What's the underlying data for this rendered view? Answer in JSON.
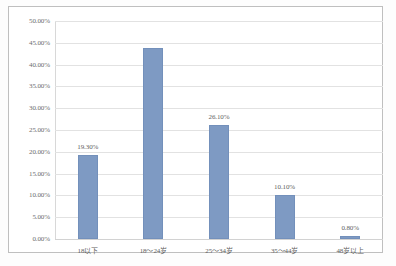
{
  "chart_data": {
    "type": "bar",
    "title": "",
    "subtitle": "",
    "xlabel": "",
    "ylabel": "",
    "categories": [
      "18以下",
      "18～24岁",
      "25～34岁",
      "35～44岁",
      "48岁以上"
    ],
    "values": [
      19.3,
      43.8,
      26.1,
      10.1,
      0.8
    ],
    "data_labels": [
      "19.30%",
      "",
      "26.10%",
      "10.10%",
      "0.80%"
    ],
    "ylim": [
      0,
      50
    ],
    "ytick_values": [
      0,
      5,
      10,
      15,
      20,
      25,
      30,
      35,
      40,
      45,
      50
    ],
    "ytick_labels": [
      "0.00%",
      "5.00%",
      "10.00%",
      "15.00%",
      "20.00%",
      "25.00%",
      "30.00%",
      "35.00%",
      "40.00%",
      "45.00%",
      "50.00%"
    ],
    "grid": true,
    "legend": false,
    "series": [
      {
        "name": "",
        "color": "#7e9ac3",
        "values": [
          19.3,
          43.8,
          26.1,
          10.1,
          0.8
        ]
      }
    ],
    "colors": {
      "bar_fill": "#7e9ac3",
      "bar_stroke": "#7390bb",
      "gridline": "#e2e2e2",
      "frame_border": "#bfbfbf",
      "tick_text": "#6d6d6d",
      "plot_background": "#ffffff"
    }
  }
}
